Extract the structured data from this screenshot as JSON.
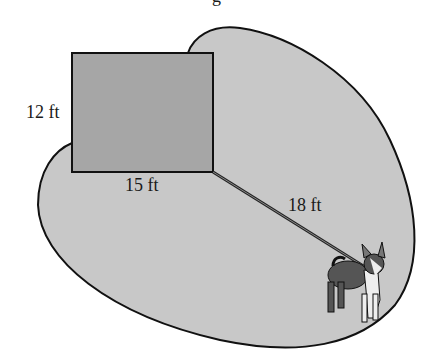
{
  "figure": {
    "title_fragment": "g",
    "shed": {
      "width_label": "15 ft",
      "height_label": "12 ft"
    },
    "leash": {
      "length_label": "18 ft"
    },
    "colors": {
      "region_fill": "#c8c8c8",
      "shed_fill": "#a6a6a6",
      "outline": "#111111",
      "background": "#ffffff"
    }
  }
}
